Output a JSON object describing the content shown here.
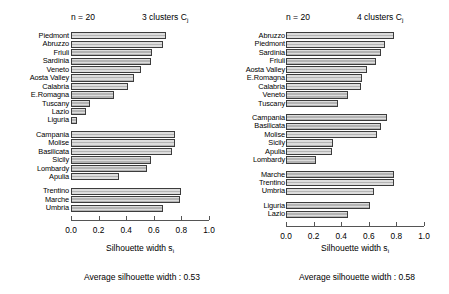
{
  "figure": {
    "width": 449,
    "height": 294,
    "bar_fill": "#b4b4b4",
    "bar_border": "#3c3c3c",
    "axis_color": "#555555"
  },
  "chart_data": [
    {
      "type": "bar",
      "orientation": "horizontal",
      "title": "3  clusters  Cj",
      "n_label": "n = 20",
      "cluster_count_label": "3  clusters  C",
      "cluster_count_sub": "j",
      "xlabel": "Silhouette width s",
      "xlabel_sub": "i",
      "ylabel": "",
      "xlim": [
        0.0,
        1.0
      ],
      "xticks": [
        0.0,
        0.2,
        0.4,
        0.6,
        0.8,
        1.0
      ],
      "xticklabels": [
        "0.0",
        "0.2",
        "0.4",
        "0.6",
        "0.8",
        "1.0"
      ],
      "grid": false,
      "legend": "none",
      "footer": "Average silhouette width :  0.53",
      "average_silhouette_width": 0.53,
      "clusters": [
        {
          "index": 1,
          "categories": [
            "Piedmont",
            "Abruzzo",
            "Friuli",
            "Sardinia",
            "Veneto",
            "Aosta Valley",
            "Calabria",
            "E.Romagna",
            "Tuscany",
            "Lazio",
            "Liguria"
          ],
          "values": [
            0.69,
            0.67,
            0.59,
            0.58,
            0.51,
            0.46,
            0.41,
            0.31,
            0.14,
            0.11,
            0.04
          ]
        },
        {
          "index": 2,
          "categories": [
            "Campania",
            "Molise",
            "Basilicata",
            "Sicily",
            "Lombardy",
            "Apulia"
          ],
          "values": [
            0.75,
            0.75,
            0.73,
            0.58,
            0.55,
            0.35
          ]
        },
        {
          "index": 3,
          "categories": [
            "Trentino",
            "Marche",
            "Umbria"
          ],
          "values": [
            0.8,
            0.79,
            0.67
          ]
        }
      ]
    },
    {
      "type": "bar",
      "orientation": "horizontal",
      "title": "4  clusters  Cj",
      "n_label": "n = 20",
      "cluster_count_label": "4  clusters  C",
      "cluster_count_sub": "j",
      "xlabel": "Silhouette width s",
      "xlabel_sub": "i",
      "ylabel": "",
      "xlim": [
        0.0,
        1.0
      ],
      "xticks": [
        0.0,
        0.2,
        0.4,
        0.6,
        0.8,
        1.0
      ],
      "xticklabels": [
        "0.0",
        "0.2",
        "0.4",
        "0.6",
        "0.8",
        "1.0"
      ],
      "grid": false,
      "legend": "none",
      "footer": "Average silhouette width :  0.58",
      "average_silhouette_width": 0.58,
      "clusters": [
        {
          "index": 1,
          "categories": [
            "Abruzzo",
            "Piedmont",
            "Sardinia",
            "Friuli",
            "Aosta Valley",
            "E.Romagna",
            "Calabria",
            "Veneto",
            "Tuscany"
          ],
          "values": [
            0.78,
            0.72,
            0.69,
            0.65,
            0.59,
            0.55,
            0.54,
            0.45,
            0.38
          ]
        },
        {
          "index": 2,
          "categories": [
            "Campania",
            "Basilicata",
            "Molise",
            "Sicily",
            "Apulia",
            "Lombardy"
          ],
          "values": [
            0.73,
            0.69,
            0.66,
            0.34,
            0.33,
            0.22
          ]
        },
        {
          "index": 3,
          "categories": [
            "Marche",
            "Trentino",
            "Umbria"
          ],
          "values": [
            0.78,
            0.78,
            0.64
          ]
        },
        {
          "index": 4,
          "categories": [
            "Liguria",
            "Lazio"
          ],
          "values": [
            0.61,
            0.45
          ]
        }
      ]
    }
  ]
}
